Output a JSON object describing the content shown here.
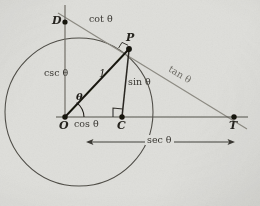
{
  "figure": {
    "background_color": "#dedeea",
    "paper_color": "#dededa",
    "ink_color": "#26241f",
    "gray_line_color": "#8a8880",
    "circle_color": "#4a4843"
  },
  "points": {
    "O": {
      "label": "O",
      "x": 65,
      "y": 117,
      "description": "origin center of unit circle"
    },
    "C": {
      "label": "C",
      "x": 122,
      "y": 117,
      "description": "foot of perpendicular from P to x-axis"
    },
    "P": {
      "label": "P",
      "x": 129,
      "y": 49,
      "description": "point on unit circle at angle theta"
    },
    "D": {
      "label": "D",
      "x": 65,
      "y": 22,
      "description": "intersection of tangent line with vertical axis"
    },
    "T": {
      "label": "T",
      "x": 234,
      "y": 117,
      "description": "intersection of tangent line with x-axis"
    }
  },
  "segment_labels": [
    {
      "id": "cot",
      "fn": "cot",
      "theta": "θ",
      "text": "cot θ",
      "x": 101,
      "y": 19,
      "style": "dark"
    },
    {
      "id": "csc",
      "fn": "csc",
      "theta": "θ",
      "text": "csc θ",
      "x": 48,
      "y": 71,
      "style": "dark"
    },
    {
      "id": "one",
      "fn": "1",
      "theta": "",
      "text": "1",
      "x": 103,
      "y": 73,
      "style": "dark"
    },
    {
      "id": "sin",
      "fn": "sin",
      "theta": "θ",
      "text": "sin θ",
      "x": 131,
      "y": 80,
      "style": "dark"
    },
    {
      "id": "tan",
      "fn": "tan",
      "theta": "θ",
      "text": "tan θ",
      "x": 176,
      "y": 68,
      "style": "gray"
    },
    {
      "id": "cos",
      "fn": "cos",
      "theta": "θ",
      "text": "cos θ",
      "x": 78,
      "y": 120,
      "style": "dark"
    },
    {
      "id": "sec",
      "fn": "sec",
      "theta": "θ",
      "text": "sec θ",
      "x": 148,
      "y": 136,
      "style": "dark"
    }
  ],
  "angle_label": {
    "id": "theta",
    "text": "θ",
    "x": 79,
    "y": 96
  },
  "circle": {
    "cx": 79,
    "cy": 112,
    "r": 74
  },
  "right_angles": [
    {
      "id": "right-angle-at-C",
      "x": 122,
      "y": 117,
      "note": "square marker between OC and CP"
    },
    {
      "id": "right-angle-at-P",
      "x": 129,
      "y": 49,
      "note": "square marker between OP and tangent DT"
    }
  ],
  "dimension_arrow": {
    "id": "sec-dimension",
    "label": "sec θ",
    "x_start": 86,
    "x_end": 235,
    "y": 142
  }
}
